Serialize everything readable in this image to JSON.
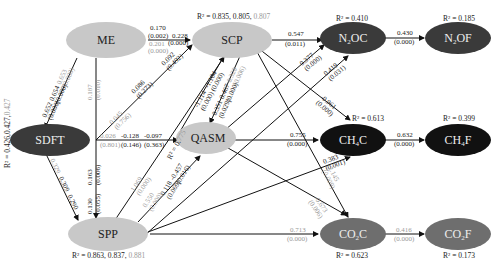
{
  "nodes": {
    "ME": {
      "label": "ME"
    },
    "SCP": {
      "label": "SCP",
      "r2": "R² = 0.835, 0.805,",
      "r2_extra": " 0.807"
    },
    "SDFT": {
      "label": "SDFT",
      "r2": "R² = 0.426,0.427,",
      "r2_extra": "0.427"
    },
    "QASM": {
      "label": "QASM",
      "r2": "R² = 0.775"
    },
    "SPP": {
      "label": "SPP",
      "r2": "R² = 0.863, 0.837,",
      "r2_extra": " 0.881"
    },
    "N2OC": {
      "label": "N",
      "sub": "2",
      "tail": "OC",
      "r2": "R² = 0.410"
    },
    "N2OF": {
      "label": "N",
      "sub": "2",
      "tail": "OF",
      "r2": "R² = 0.185"
    },
    "CH4C": {
      "label": "CH",
      "sub": "4",
      "tail": "C",
      "r2": "R² = 0.613"
    },
    "CH4F": {
      "label": "CH",
      "sub": "4",
      "tail": "F",
      "r2": "R² = 0.399"
    },
    "CO2C": {
      "label": "CO",
      "sub": "2",
      "tail": "C",
      "r2": "R² = 0.623"
    },
    "CO2F": {
      "label": "CO",
      "sub": "2",
      "tail": "F",
      "r2": "R² = 0.173"
    }
  },
  "paths": {
    "me_scp_a": "0.170",
    "me_scp_a_p": "(0.002)",
    "me_scp_b": "0.228",
    "me_scp_b_p": "(0.000)",
    "me_scp_c": "0.201",
    "me_scp_c_p": "(0.000)",
    "me_sdft_a": "0.652",
    "me_sdft_b": "0.654",
    "me_sdft_c": "0.653",
    "me_sdft_pa": "(0.000)",
    "me_sdft_pb": "(0.000)",
    "me_sdft_pc": "(0.000)",
    "me_spp": "0.187",
    "me_spp_p": "(0.010)",
    "sdft_scp_a": "0.086",
    "sdft_scp_a_p": "(0.273)",
    "sdft_scp_b": "0.092",
    "sdft_scp_b_p": "(0.492)",
    "sdft_scp_c": "0.045",
    "sdft_scp_c_p": "(0.756)",
    "sdft_qasm_a": "0.026",
    "sdft_qasm_a_p": "(0.801)",
    "sdft_qasm_b": "-0.128",
    "sdft_qasm_b_p": "(0.146)",
    "sdft_qasm_c": "-0.097",
    "sdft_qasm_c_p": "(0.363)",
    "sdft_spp_a": "0.163",
    "sdft_spp_a_p": "(0.006)",
    "sdft_spp_b": "0.130",
    "sdft_spp_b_p": "(0.055)",
    "sdft_spp_c1": "0.329",
    "sdft_spp_c2": "0.309",
    "sdft_spp_c3": "0.290",
    "scp_qasm_a": "-1.114",
    "scp_qasm_b": "-1.104",
    "scp_qasm_pa": "(0.000)",
    "scp_qasm_pb": "(0.000)",
    "qasm_scp_a": "0.351",
    "qasm_scp_b": "0.467",
    "qasm_scp_c": "0.320",
    "qasm_scp_pa": "(0.029)",
    "qasm_scp_pb": "(0.000)",
    "qasm_scp_pc": "(0.006)",
    "spp_qasm_a": "0.118",
    "spp_qasm_b": "-0.457",
    "spp_qasm_pa": "(0.069)",
    "spp_qasm_pb": "(0.016)",
    "spp_scp": "1.069",
    "spp_scp_p": "(0.000)",
    "spp_qasm_c": "0.550",
    "spp_qasm_c_p": "(0.000)",
    "scp_n2oc": "0.547",
    "scp_n2oc_p": "(0.011)",
    "n2oc_n2of": "0.430",
    "n2oc_n2of_p": "(0.000)",
    "qasm_n2oc": "0.377",
    "qasm_n2oc_p": "(0.000)",
    "spp_n2oc": "0.419",
    "spp_n2oc_p": "(0.031)",
    "scp_ch4c": "-0.961",
    "scp_ch4c_p": "(0.000)",
    "qasm_ch4c": "0.755",
    "qasm_ch4c_p": "(0.000)",
    "ch4c_ch4f": "0.632",
    "ch4c_ch4f_p": "(0.000)",
    "spp_ch4c": "0.383",
    "spp_ch4c_p": "(0.001)",
    "scp_co2c": "2.145",
    "scp_co2c_p": "(0.009)",
    "qasm_co2c": "-0.673",
    "qasm_co2c_p": "(0.006)",
    "spp_co2c": "0.713",
    "spp_co2c_p": "(0.000)",
    "co2c_co2f": "0.416",
    "co2c_co2f_p": "(0.000)"
  },
  "colors": {
    "light_node": "#c8c8c8",
    "dark_node": "#3a3a3a",
    "black_node": "#111111",
    "mid_node": "#6e6e6e",
    "line": "#111111",
    "grey_text": "#9a9a9a"
  }
}
